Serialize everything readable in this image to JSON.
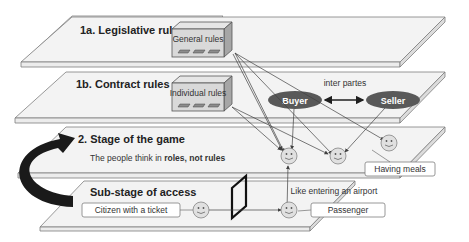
{
  "layers": {
    "legislative": {
      "title": "1a. Legislative rules",
      "box_label": "General rules"
    },
    "contract": {
      "title": "1b. Contract rules",
      "box_label": "Individual rules",
      "relation_label": "inter partes",
      "party_a": "Buyer",
      "party_b": "Seller"
    },
    "game": {
      "title": "2. Stage of the game",
      "caption_prefix": "The people think in ",
      "caption_bold": "roles, not rules",
      "callout_meals": "Having meals"
    },
    "access": {
      "title": "Sub-stage of access",
      "callout_citizen": "Citizen with a ticket",
      "gate_caption": "Like entering an airport",
      "callout_passenger": "Passenger"
    }
  },
  "colors": {
    "plate_fill": "#f2f2f2",
    "plate_stroke": "#7f7f7f",
    "box_fill": "#d9d9d9",
    "ellipse_fill": "#595959",
    "face_fill": "#e0e0e0",
    "arrow": "#404040",
    "cycle_arrow": "#1a1a1a"
  }
}
